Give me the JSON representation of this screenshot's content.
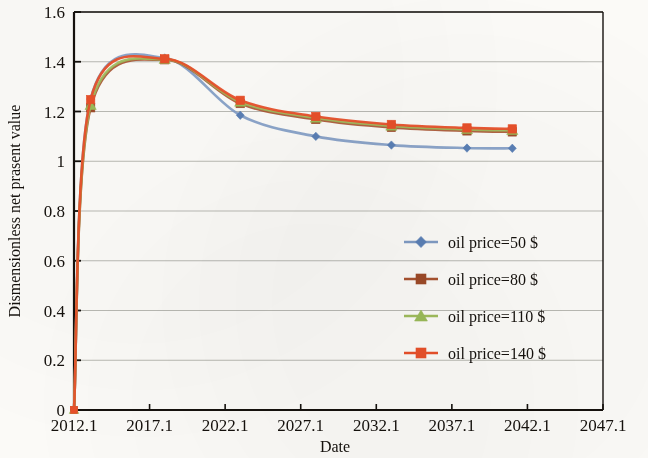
{
  "figure": {
    "background_color": "#fbfaf7",
    "frame_color": "#15110d",
    "gridline_color": "#b9b9b3"
  },
  "chart_data": {
    "type": "line",
    "title": "",
    "xlabel": "Date",
    "ylabel": "Dismensionless net prasent value",
    "xlim": [
      2012.1,
      2047.1
    ],
    "ylim": [
      0,
      1.6
    ],
    "xticks": [
      "2012.1",
      "2017.1",
      "2022.1",
      "2027.1",
      "2032.1",
      "2037.1",
      "2042.1",
      "2047.1"
    ],
    "xtick_values": [
      2012.1,
      2017.1,
      2022.1,
      2027.1,
      2032.1,
      2037.1,
      2042.1,
      2047.1
    ],
    "yticks": [
      "0",
      "0.2",
      "0.4",
      "0.6",
      "0.8",
      "1",
      "1.2",
      "1.4",
      "1.6"
    ],
    "ytick_values": [
      0,
      0.2,
      0.4,
      0.6,
      0.8,
      1,
      1.2,
      1.4,
      1.6
    ],
    "grid": "horizontal",
    "legend_position": "center-right",
    "x": [
      2012.1,
      2013.2,
      2018.1,
      2023.1,
      2028.1,
      2033.1,
      2038.1,
      2041.1
    ],
    "series": [
      {
        "name": "oil price=50 $",
        "color": "#7f9bc4",
        "marker": "diamond",
        "marker_color": "#5a7fb5",
        "values": [
          0.0,
          1.25,
          1.415,
          1.185,
          1.1,
          1.065,
          1.053,
          1.052
        ]
      },
      {
        "name": "oil price=80 $",
        "color": "#a8522f",
        "marker": "square",
        "marker_color": "#9d4a28",
        "values": [
          0.0,
          1.215,
          1.408,
          1.232,
          1.168,
          1.136,
          1.122,
          1.118
        ]
      },
      {
        "name": "oil price=110 $",
        "color": "#9fbc5c",
        "marker": "triangle",
        "marker_color": "#9abb59",
        "values": [
          0.0,
          1.225,
          1.41,
          1.238,
          1.174,
          1.142,
          1.128,
          1.124
        ]
      },
      {
        "name": "oil price=140 $",
        "color": "#e8502a",
        "marker": "square",
        "marker_color": "#e8502a",
        "values": [
          0.0,
          1.248,
          1.412,
          1.245,
          1.18,
          1.148,
          1.134,
          1.13
        ]
      }
    ]
  },
  "legend": {
    "entries": [
      {
        "label": "oil price=50 $",
        "marker": "diamond-marker",
        "color": "#5a7fb5",
        "line_color": "#7f9bc4"
      },
      {
        "label": "oil price=80 $",
        "marker": "square-marker",
        "color": "#9d4a28",
        "line_color": "#a8522f"
      },
      {
        "label": "oil price=110 $",
        "marker": "triangle-marker",
        "color": "#9abb59",
        "line_color": "#9fbc5c"
      },
      {
        "label": "oil price=140 $",
        "marker": "square-marker",
        "color": "#e8502a",
        "line_color": "#e8502a"
      }
    ]
  }
}
